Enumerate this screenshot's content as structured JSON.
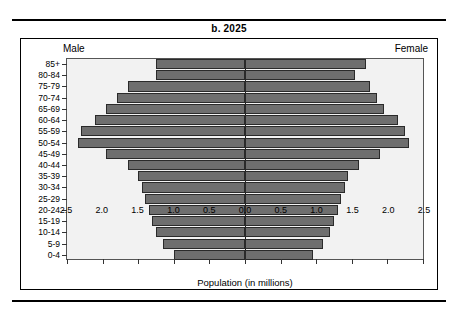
{
  "figure": {
    "title": "b. 2025",
    "male_label": "Male",
    "female_label": "Female",
    "xaxis_title": "Population (in millions)",
    "bar_color": "#6e6e6e",
    "bar_border_color": "#2a2a2a",
    "plot_background": "#f2f2f2",
    "center_line_color": "#1a1a1a"
  },
  "chart_data": {
    "type": "bar",
    "subtype": "population-pyramid",
    "title": "b. 2025",
    "xlabel": "Population (in millions)",
    "ylabel": "",
    "orientation": "horizontal",
    "grid": false,
    "legend": [
      "Male",
      "Female"
    ],
    "legend_position": "top-corners",
    "xlim": [
      -2.5,
      2.5
    ],
    "xticks": [
      -2.5,
      -2.0,
      -1.5,
      -1.0,
      -0.5,
      0.0,
      0.5,
      1.0,
      1.5,
      2.0,
      2.5
    ],
    "xticklabels": [
      "2.5",
      "2.0",
      "1.5",
      "1.0",
      "0.5",
      "0.0",
      "0.5",
      "1.0",
      "1.5",
      "2.0",
      "2.5"
    ],
    "categories": [
      "85+",
      "80-84",
      "75-79",
      "70-74",
      "65-69",
      "60-64",
      "55-59",
      "50-54",
      "45-49",
      "40-44",
      "35-39",
      "30-34",
      "25-29",
      "20-24",
      "15-19",
      "10-14",
      "5-9",
      "0-4"
    ],
    "series": [
      {
        "name": "Male",
        "side": "left",
        "values": [
          1.25,
          1.25,
          1.65,
          1.8,
          1.95,
          2.1,
          2.3,
          2.35,
          1.95,
          1.65,
          1.5,
          1.45,
          1.4,
          1.35,
          1.3,
          1.25,
          1.15,
          1.0
        ]
      },
      {
        "name": "Female",
        "side": "right",
        "values": [
          1.7,
          1.55,
          1.75,
          1.85,
          1.95,
          2.15,
          2.25,
          2.3,
          1.9,
          1.6,
          1.45,
          1.4,
          1.35,
          1.3,
          1.25,
          1.2,
          1.1,
          0.95
        ]
      }
    ]
  }
}
